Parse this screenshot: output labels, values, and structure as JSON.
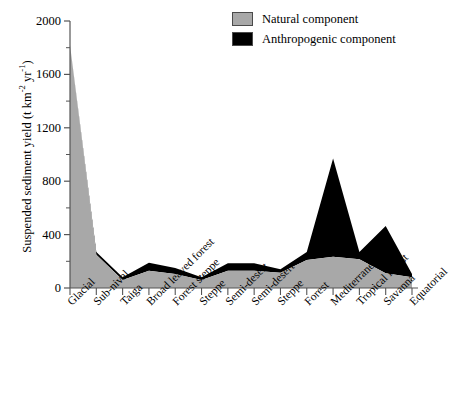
{
  "chart_data": {
    "type": "area",
    "title": "",
    "subtitle": "",
    "xlabel": "",
    "ylabel": "Suspended sediment yield (t km−2 yr−1)",
    "ylabel_parts": {
      "main": "Suspended sediment yield (t km",
      "sup1": "-2",
      "mid": " yr",
      "sup2": "-1",
      "end": ")"
    },
    "categories": [
      "Glacial",
      "Sub-nival",
      "Taiga",
      "Broad leaved forest",
      "Forest steppe",
      "Steppe",
      "Semi-desert",
      "Semi-desert",
      "Steppe",
      "Forest",
      "Mediterranean",
      "Tropical forest",
      "Savanna",
      "Equatorial"
    ],
    "series": [
      {
        "name": "Natural component",
        "color": "#a8a8a8",
        "values": [
          1820,
          250,
          60,
          130,
          105,
          60,
          130,
          130,
          115,
          210,
          235,
          215,
          110,
          80
        ]
      },
      {
        "name": "Anthropogenic component",
        "color": "#000000",
        "values": [
          0,
          20,
          20,
          60,
          45,
          20,
          55,
          55,
          25,
          60,
          735,
          55,
          355,
          25
        ]
      }
    ],
    "totals": [
      1820,
      270,
      80,
      190,
      150,
      80,
      185,
      185,
      140,
      270,
      970,
      270,
      465,
      105
    ],
    "stacked": true,
    "ylim": [
      0,
      2000
    ],
    "yticks": [
      0,
      400,
      800,
      1200,
      1600,
      2000
    ],
    "yminorticks": [
      200,
      600,
      1000,
      1400,
      1800
    ],
    "grid": false,
    "legend_position": "top-right"
  },
  "legend": {
    "items": [
      {
        "label": "Natural component",
        "color": "#a8a8a8"
      },
      {
        "label": "Anthropogenic component",
        "color": "#000000"
      }
    ]
  },
  "axes": {
    "y_tick_labels": [
      "2000",
      "1600",
      "1200",
      "800",
      "400",
      "0"
    ]
  }
}
